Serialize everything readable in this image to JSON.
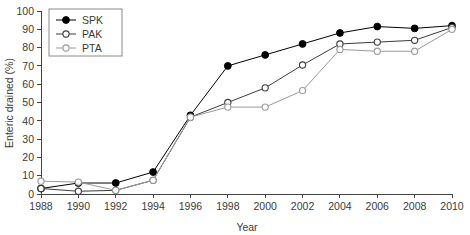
{
  "chart_data": {
    "type": "line",
    "title": "",
    "xlabel": "Year",
    "ylabel": "Enteric drained (%)",
    "xlim": [
      1988,
      2010
    ],
    "ylim": [
      0,
      100
    ],
    "xticks": [
      1988,
      1990,
      1992,
      1994,
      1996,
      1998,
      2000,
      2002,
      2004,
      2006,
      2008,
      2010
    ],
    "yticks": [
      0,
      10,
      20,
      30,
      40,
      50,
      60,
      70,
      80,
      90,
      100
    ],
    "grid": false,
    "legend_position": "top-left",
    "x": [
      1988,
      1990,
      1992,
      1994,
      1996,
      1998,
      2000,
      2002,
      2004,
      2006,
      2008,
      2010
    ],
    "series": [
      {
        "name": "SPK",
        "marker": "filled-circle",
        "color": "#000000",
        "values": [
          3,
          6,
          6,
          12,
          43,
          70,
          76,
          82,
          88,
          91.5,
          90.5,
          92
        ]
      },
      {
        "name": "PAK",
        "marker": "open-circle",
        "color": "#3c3c3c",
        "values": [
          3,
          1.5,
          2,
          7.5,
          42,
          50,
          58,
          70.5,
          82,
          83,
          84,
          91
        ]
      },
      {
        "name": "PTA",
        "marker": "open-circle",
        "color": "#9a9a9a",
        "values": [
          7,
          6.5,
          2,
          7.5,
          42,
          47.5,
          47.5,
          56.5,
          79,
          78,
          78,
          90
        ]
      }
    ]
  },
  "legend": {
    "entries": [
      {
        "label": "SPK"
      },
      {
        "label": "PAK"
      },
      {
        "label": "PTA"
      }
    ]
  }
}
